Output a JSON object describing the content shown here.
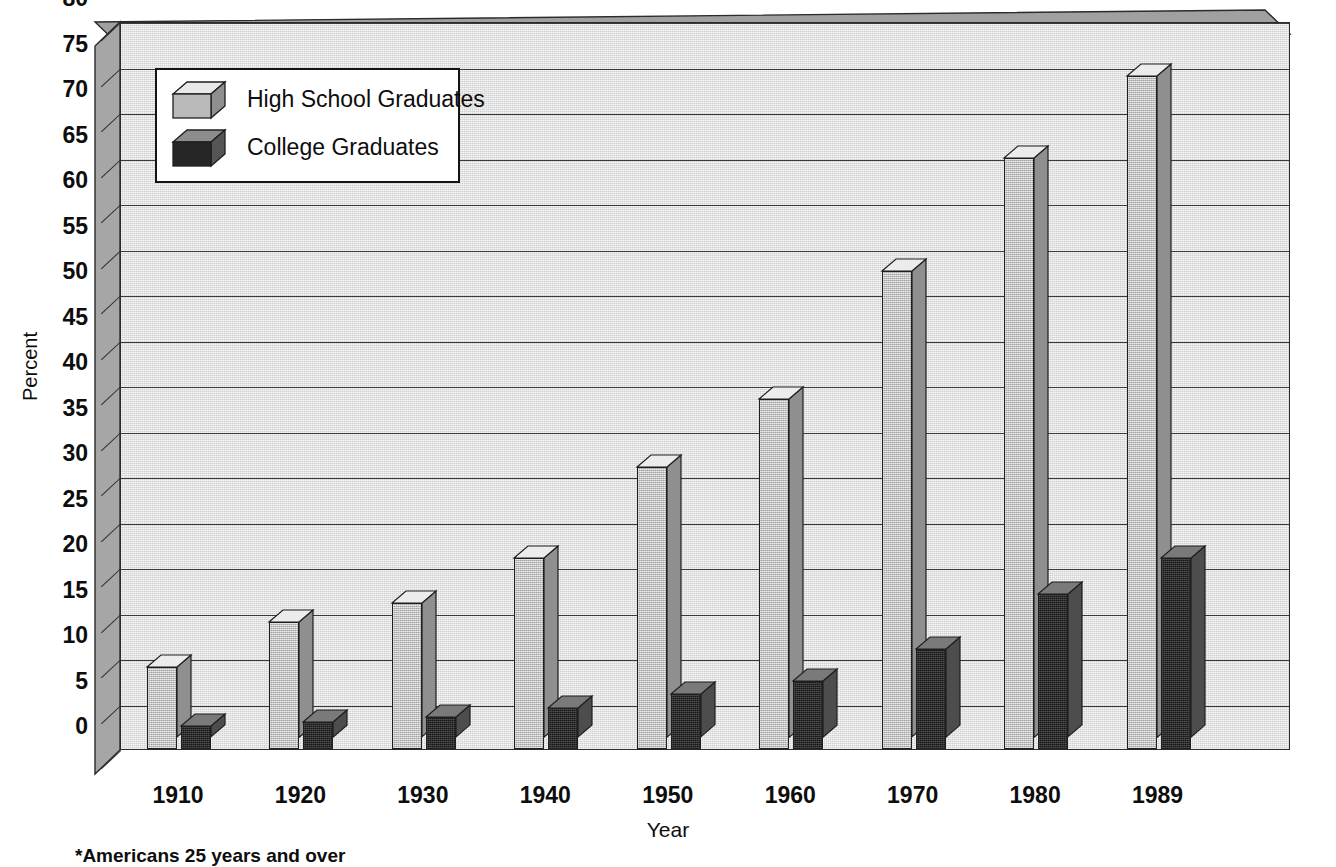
{
  "chart_data": {
    "type": "bar",
    "title": "",
    "subtitle": "",
    "xlabel": "Year",
    "ylabel": "Percent",
    "categories": [
      "1910",
      "1920",
      "1930",
      "1940",
      "1950",
      "1960",
      "1970",
      "1980",
      "1989"
    ],
    "series": [
      {
        "name": "High School Graduates",
        "color": "#b9b9b9",
        "values": [
          9,
          14,
          16,
          21,
          31,
          38.5,
          52.5,
          65,
          74
        ]
      },
      {
        "name": "College Graduates",
        "color": "#2a2a2a",
        "values": [
          2.5,
          3,
          3.5,
          4.5,
          6,
          7.5,
          11,
          17,
          21
        ]
      }
    ],
    "ylim": [
      0,
      80
    ],
    "ytick_step": 5,
    "yticks": [
      "80",
      "75",
      "70",
      "65",
      "60",
      "55",
      "50",
      "45",
      "40",
      "35",
      "30",
      "25",
      "20",
      "15",
      "10",
      "5",
      "0"
    ],
    "grid": true,
    "legend_position": "top-left",
    "style": "3d-columns"
  },
  "axis": {
    "y_title": "Percent",
    "x_title": "Year"
  },
  "legend": {
    "entries": [
      {
        "label": "High School Graduates",
        "swatch": "light-gray-cube"
      },
      {
        "label": "College Graduates",
        "swatch": "dark-gray-cube"
      }
    ]
  },
  "footnote": "*Americans 25 years and over"
}
